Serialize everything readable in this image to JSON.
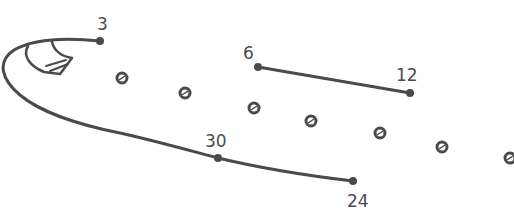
{
  "colors": {
    "stroke": "#4a4a4a",
    "background": "#ffffff"
  },
  "labels": [
    {
      "id": "p3",
      "text": "3",
      "x": 97,
      "y": 16
    },
    {
      "id": "p6",
      "text": "6",
      "x": 243,
      "y": 45
    },
    {
      "id": "p12",
      "text": "12",
      "x": 396,
      "y": 67
    },
    {
      "id": "p30",
      "text": "30",
      "x": 205,
      "y": 133
    },
    {
      "id": "p24",
      "text": "24",
      "x": 347,
      "y": 193
    }
  ],
  "points": {
    "p3": [
      100,
      41
    ],
    "p6": [
      258,
      67
    ],
    "p12": [
      410,
      93
    ],
    "p30": [
      218,
      158
    ],
    "p24": [
      353,
      181
    ]
  },
  "small_dots": [
    [
      122,
      78
    ],
    [
      185,
      93
    ],
    [
      254,
      108
    ],
    [
      311,
      121
    ],
    [
      380,
      133
    ],
    [
      442,
      147
    ],
    [
      510,
      158
    ]
  ]
}
